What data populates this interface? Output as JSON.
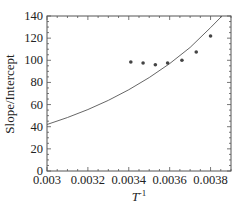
{
  "chart_data": {
    "type": "scatter",
    "title": "",
    "xlabel": "T",
    "xlabel_superscript": "-1",
    "ylabel": "Slope/Intercept",
    "xlim": [
      0.003,
      0.0039
    ],
    "ylim": [
      0,
      140
    ],
    "x_ticks": [
      "0.003",
      "0.0032",
      "0.0034",
      "0.0036",
      "0.0038"
    ],
    "x_tick_values": [
      0.003,
      0.0032,
      0.0034,
      0.0036,
      0.0038
    ],
    "y_ticks": [
      "0",
      "20",
      "40",
      "60",
      "80",
      "100",
      "120",
      "140"
    ],
    "y_tick_values": [
      0,
      20,
      40,
      60,
      80,
      100,
      120,
      140
    ],
    "grid": false,
    "legend": null,
    "series": [
      {
        "name": "data points",
        "kind": "scatter",
        "x": [
          0.00341,
          0.00347,
          0.00353,
          0.00359,
          0.00366,
          0.00373,
          0.0038
        ],
        "y": [
          98.5,
          97.5,
          96,
          97.5,
          100,
          107.5,
          122
        ]
      },
      {
        "name": "fitted curve",
        "kind": "line",
        "x": [
          0.003,
          0.0031,
          0.0032,
          0.0033,
          0.0034,
          0.0035,
          0.0036,
          0.0037,
          0.0038,
          0.003856
        ],
        "y": [
          42,
          48.3,
          55.5,
          63.8,
          73.4,
          84.4,
          97.0,
          111.6,
          129.5,
          140
        ]
      }
    ]
  },
  "colors": {
    "axis": "#555555",
    "curve": "#555555",
    "points": "#444444",
    "text": "#222222"
  }
}
